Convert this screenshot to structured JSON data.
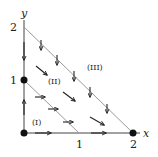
{
  "diagram": {
    "type": "phase-portrait",
    "axes": {
      "x_label": "x",
      "y_label": "y",
      "x_ticks": [
        "1",
        "2"
      ],
      "y_ticks": [
        "1",
        "2"
      ]
    },
    "regions": [
      {
        "label": "(I)",
        "x": 0.35,
        "y": 0.3
      },
      {
        "label": "(II)",
        "x": 0.75,
        "y": 1.05
      },
      {
        "label": "(III)",
        "x": 1.35,
        "y": 1.4
      }
    ],
    "lines": [
      {
        "name": "inner-diagonal",
        "from": [
          0,
          1
        ],
        "to": [
          1,
          0
        ]
      },
      {
        "name": "outer-diagonal",
        "from": [
          0,
          2
        ],
        "to": [
          2,
          0
        ]
      }
    ],
    "equilibria": [
      {
        "x": 0,
        "y": 0
      },
      {
        "x": 0,
        "y": 1
      },
      {
        "x": 2,
        "y": 0
      }
    ],
    "colors": {
      "axis": "#333333",
      "diagonal": "#9a9a9a",
      "arrow": "#222222",
      "dot": "#111111"
    }
  }
}
